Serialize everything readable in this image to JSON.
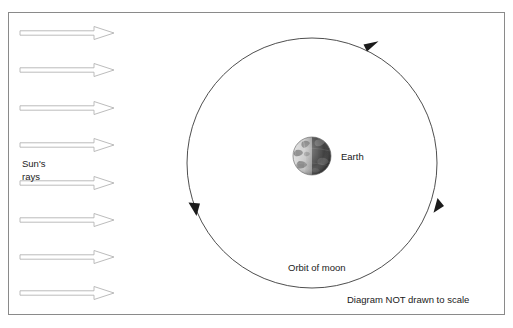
{
  "diagram": {
    "frame": {
      "x": 8,
      "y": 12,
      "width": 497,
      "height": 303,
      "stroke": "#8a8a8a"
    },
    "labels": {
      "sun_rays_line1": "Sun's",
      "sun_rays_line2": "rays",
      "earth": "Earth",
      "orbit_of_moon": "Orbit of moon",
      "scale_note": "Diagram NOT drawn to scale"
    },
    "sun_rays": {
      "count": 8,
      "direction": "left-to-right",
      "shaft_start_x": 20,
      "shaft_end_x": 94,
      "tip_x": 114,
      "shaft_half_height": 2.2,
      "head_half_height": 6.5,
      "stroke": "#b4b4b4",
      "fill": "#ffffff",
      "y_positions": [
        33,
        70,
        108,
        145,
        183,
        220,
        257,
        293
      ]
    },
    "orbit": {
      "center_x": 312,
      "center_y": 163,
      "radius": 125,
      "stroke": "#3a3a3a",
      "direction": "counterclockwise",
      "arrowheads": [
        {
          "name": "orbit-arrow-top",
          "angle_deg": 290,
          "label": "top"
        },
        {
          "name": "orbit-arrow-left",
          "angle_deg": 175,
          "label": "left"
        },
        {
          "name": "orbit-arrow-right",
          "angle_deg": 20,
          "label": "right"
        }
      ]
    },
    "earth_globe": {
      "center_x": 312,
      "center_y": 156,
      "radius": 19,
      "lit_side": "left",
      "lit_color": "#c9c9c9",
      "dark_color": "#3d3d3d",
      "label_x": 341,
      "label_y": 160
    },
    "text_positions": {
      "sun_rays_x": 22,
      "sun_rays_y1": 163,
      "sun_rays_y2": 176,
      "orbit_label_x": 288,
      "orbit_label_y": 271,
      "scale_note_x": 347,
      "scale_note_y": 303
    },
    "colors": {
      "background": "#ffffff",
      "text": "#1a1a1a",
      "frame_border": "#8a8a8a",
      "ray_stroke": "#b4b4b4",
      "orbit_stroke": "#3a3a3a"
    }
  }
}
